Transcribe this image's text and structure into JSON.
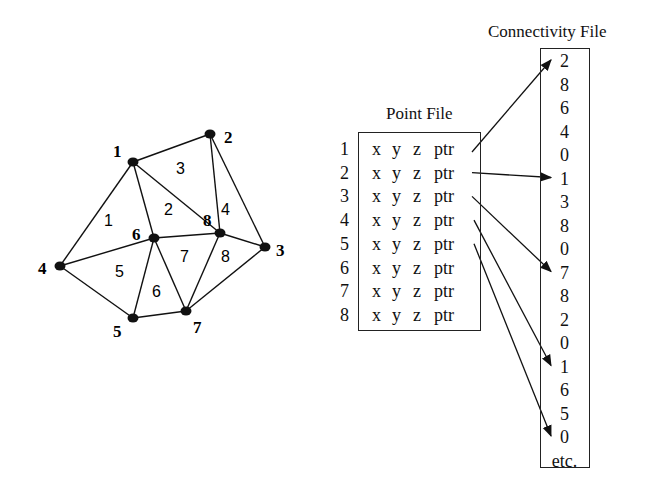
{
  "mesh": {
    "nodes": [
      {
        "id": "1",
        "x": 133,
        "y": 162,
        "lx": 113,
        "ly": 157
      },
      {
        "id": "2",
        "x": 210,
        "y": 134,
        "lx": 224,
        "ly": 143
      },
      {
        "id": "3",
        "x": 265,
        "y": 247,
        "lx": 276,
        "ly": 256
      },
      {
        "id": "4",
        "x": 60,
        "y": 266,
        "lx": 38,
        "ly": 274
      },
      {
        "id": "5",
        "x": 133,
        "y": 318,
        "lx": 113,
        "ly": 337
      },
      {
        "id": "6",
        "x": 154,
        "y": 238,
        "lx": 132,
        "ly": 240
      },
      {
        "id": "7",
        "x": 186,
        "y": 311,
        "lx": 193,
        "ly": 333
      },
      {
        "id": "8",
        "x": 220,
        "y": 233,
        "lx": 203,
        "ly": 226
      }
    ],
    "edges": [
      [
        1,
        2
      ],
      [
        1,
        4
      ],
      [
        1,
        6
      ],
      [
        1,
        8
      ],
      [
        2,
        8
      ],
      [
        2,
        3
      ],
      [
        8,
        3
      ],
      [
        6,
        8
      ],
      [
        4,
        6
      ],
      [
        4,
        5
      ],
      [
        5,
        6
      ],
      [
        5,
        7
      ],
      [
        6,
        7
      ],
      [
        7,
        8
      ],
      [
        7,
        3
      ]
    ],
    "triangles": [
      {
        "id": "1",
        "x": 104,
        "y": 226
      },
      {
        "id": "2",
        "x": 164,
        "y": 215
      },
      {
        "id": "3",
        "x": 176,
        "y": 174
      },
      {
        "id": "4",
        "x": 221,
        "y": 215
      },
      {
        "id": "5",
        "x": 115,
        "y": 277
      },
      {
        "id": "6",
        "x": 152,
        "y": 297
      },
      {
        "id": "7",
        "x": 180,
        "y": 262
      },
      {
        "id": "8",
        "x": 221,
        "y": 262
      }
    ]
  },
  "point_file": {
    "title": "Point File",
    "rows": [
      {
        "index": "1",
        "x": "x",
        "y": "y",
        "z": "z",
        "ptr": "ptr"
      },
      {
        "index": "2",
        "x": "x",
        "y": "y",
        "z": "z",
        "ptr": "ptr"
      },
      {
        "index": "3",
        "x": "x",
        "y": "y",
        "z": "z",
        "ptr": "ptr"
      },
      {
        "index": "4",
        "x": "x",
        "y": "y",
        "z": "z",
        "ptr": "ptr"
      },
      {
        "index": "5",
        "x": "x",
        "y": "y",
        "z": "z",
        "ptr": "ptr"
      },
      {
        "index": "6",
        "x": "x",
        "y": "y",
        "z": "z",
        "ptr": "ptr"
      },
      {
        "index": "7",
        "x": "x",
        "y": "y",
        "z": "z",
        "ptr": "ptr"
      },
      {
        "index": "8",
        "x": "x",
        "y": "y",
        "z": "z",
        "ptr": "ptr"
      }
    ]
  },
  "connectivity_file": {
    "title": "Connectivity File",
    "values": [
      "2",
      "8",
      "6",
      "4",
      "0",
      "1",
      "3",
      "8",
      "0",
      "7",
      "8",
      "2",
      "0",
      "1",
      "6",
      "5",
      "0",
      "etc."
    ]
  },
  "pointers": [
    {
      "from_row": 1,
      "to_index": 0
    },
    {
      "from_row": 2,
      "to_index": 5
    },
    {
      "from_row": 3,
      "to_index": 9
    },
    {
      "from_row": 4,
      "to_index": 13
    },
    {
      "from_row": 5,
      "to_index": 16
    }
  ]
}
